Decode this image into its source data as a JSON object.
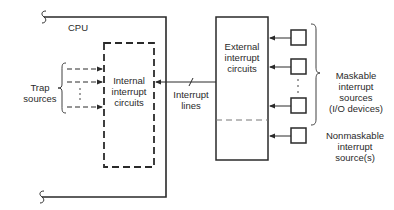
{
  "diagram": {
    "cpu_label": "CPU",
    "internal_box": {
      "lines": [
        "Internal",
        "interrupt",
        "circuits"
      ]
    },
    "external_box": {
      "lines": [
        "External",
        "interrupt",
        "circuits"
      ]
    },
    "interrupt_lines": {
      "lines": [
        "Interrupt",
        "lines"
      ]
    },
    "trap_sources": {
      "lines": [
        "Trap",
        "sources"
      ]
    },
    "maskable": {
      "lines": [
        "Maskable",
        "interrupt",
        "sources",
        "(I/O devices)"
      ]
    },
    "nonmaskable": {
      "lines": [
        "Nonmaskable",
        "interrupt",
        "source(s)"
      ]
    },
    "colors": {
      "stroke": "#2a2a2a",
      "dashed_divider": "#777777",
      "background": "#ffffff"
    }
  }
}
